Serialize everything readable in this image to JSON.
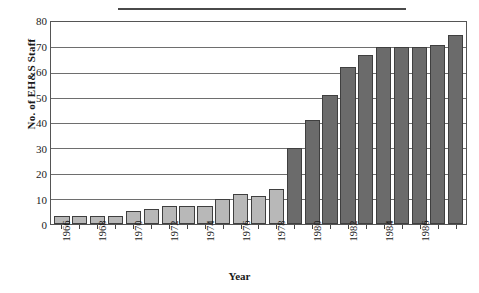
{
  "chart_data": {
    "type": "bar",
    "title": "",
    "xlabel": "Year",
    "ylabel": "No. of EH&S Staff",
    "ylim": [
      0,
      80
    ],
    "yticks": [
      0,
      10,
      20,
      30,
      40,
      50,
      60,
      70,
      80
    ],
    "grid": true,
    "legend": "none",
    "categories": [
      "1966",
      "1967",
      "1968",
      "1969",
      "1970",
      "1971",
      "1972",
      "1973",
      "1974",
      "1975",
      "1976",
      "1977",
      "1978",
      "1979",
      "1980",
      "1981",
      "1982",
      "1983",
      "1984",
      "1985",
      "1986",
      "1987",
      "1988"
    ],
    "tick_labels": [
      "1966",
      "",
      "1968",
      "",
      "1970",
      "",
      "1972",
      "",
      "1974",
      "",
      "1976",
      "",
      "1978",
      "",
      "1980",
      "",
      "1982",
      "",
      "1984",
      "",
      "1986",
      "",
      ""
    ],
    "values": [
      3,
      3,
      3,
      3,
      5,
      6,
      7,
      7,
      7,
      10,
      12,
      11,
      14,
      30,
      41,
      51,
      62,
      67,
      70,
      70,
      70,
      71,
      75
    ],
    "bar_colors": [
      "#b8b8b8",
      "#b8b8b8",
      "#b8b8b8",
      "#b8b8b8",
      "#b8b8b8",
      "#b8b8b8",
      "#b8b8b8",
      "#b8b8b8",
      "#b8b8b8",
      "#b8b8b8",
      "#b8b8b8",
      "#b8b8b8",
      "#b8b8b8",
      "#6b6b6b",
      "#6b6b6b",
      "#6b6b6b",
      "#6b6b6b",
      "#6b6b6b",
      "#6b6b6b",
      "#6b6b6b",
      "#6b6b6b",
      "#6b6b6b",
      "#6b6b6b"
    ],
    "colors": {
      "light_bar": "#b8b8b8",
      "dark_bar": "#6b6b6b",
      "bar_outline": "#3f3f3f",
      "gridline": "#6e6e6e",
      "axis": "#555555",
      "text": "#1a1a1a"
    }
  }
}
